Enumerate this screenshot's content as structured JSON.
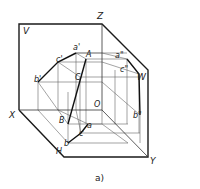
{
  "figure": {
    "caption": "a)",
    "planes": {
      "V": "V",
      "W": "W",
      "H": "H"
    },
    "axes": {
      "X": "X",
      "Y": "Y",
      "Z": "Z",
      "O": "O"
    },
    "points": {
      "A": "A",
      "B": "B",
      "C": "C",
      "a_prime": "a'",
      "b_prime": "b'",
      "c_prime": "c'",
      "a_dbl": "a\"",
      "b_dbl": "b\"",
      "c_dbl": "c\"",
      "a": "a",
      "b": "b",
      "c": "c"
    }
  },
  "colors": {
    "frame": "#1a1a1a",
    "construction": "#555555",
    "object": "#111111"
  }
}
